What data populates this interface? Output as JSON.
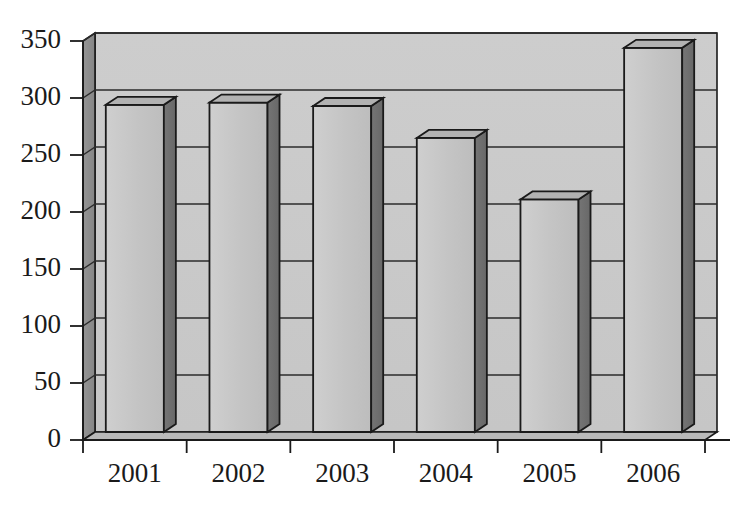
{
  "chart_data": {
    "type": "bar",
    "title": "",
    "subtitle": "",
    "xlabel": "",
    "ylabel": "",
    "categories": [
      "2001",
      "2002",
      "2003",
      "2004",
      "2005",
      "2006"
    ],
    "values": [
      294,
      296,
      293,
      265,
      211,
      344
    ],
    "series": [
      {
        "name": "",
        "values": [
          294,
          296,
          293,
          265,
          211,
          344
        ]
      }
    ],
    "ylim": [
      0,
      350
    ],
    "ytick_labels": [
      "0",
      "50",
      "100",
      "150",
      "200",
      "250",
      "300",
      "350"
    ],
    "ytick_values": [
      0,
      50,
      100,
      150,
      200,
      250,
      300,
      350
    ],
    "grid": true,
    "grid_axis": "y",
    "legend": false,
    "legend_position": "none",
    "style": "3d-column",
    "annotations": []
  },
  "colors": {
    "bar_front": "#c3c3c3",
    "bar_side": "#6f6f6f",
    "bar_top": "#b2b2b2",
    "wall_back": "#c9c9c9",
    "wall_left": "#8c8c8c",
    "floor": "#b9b9b9",
    "outline": "#1a1a1a",
    "gridline": "#2b2b2b",
    "text": "#1a1a1a",
    "background": "#ffffff"
  },
  "axes": {
    "y_axis_name": "value-axis",
    "x_axis_name": "category-axis",
    "tick_mark_color": "#1a1a1a"
  }
}
